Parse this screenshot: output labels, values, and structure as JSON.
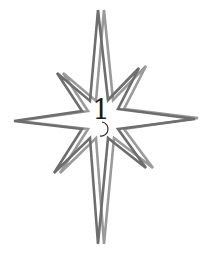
{
  "diagram": {
    "shape": "eight-pointed-star",
    "label": "1",
    "colors": {
      "stroke_dark": "#6e6e6e",
      "stroke_light": "#9a9a9a",
      "label": "#1a1a1a",
      "background": "#ffffff"
    },
    "outlines": [
      {
        "name": "star-outline-dark",
        "points": "98,10 108,100 139,68 118,109 195,119 118,129 146,168 108,138 98,244 90,138 54,173 82,129 14,121 82,111 57,73 90,101"
      },
      {
        "name": "star-outline-light",
        "points": "104,10 113,100 146,66 124,109 198,118 124,129 153,168 114,138 104,244 96,138 60,173 88,129 18,121 88,111 63,73 96,101"
      }
    ]
  }
}
